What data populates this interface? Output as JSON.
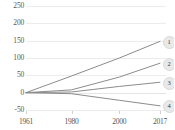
{
  "chart_data": {
    "type": "line",
    "title": "",
    "xlabel": "",
    "ylabel": "",
    "xlim": [
      1961,
      2017
    ],
    "ylim": [
      -50,
      250
    ],
    "grid": true,
    "legend_position": "right-inline-badges",
    "yticks": [
      250,
      200,
      150,
      100,
      50,
      0,
      -50
    ],
    "ytick_labels": [
      "250",
      "200",
      "150",
      "100",
      "50",
      "0",
      "-50"
    ],
    "xticks": [
      1961,
      1980,
      2000,
      2017
    ],
    "xtick_labels": [
      "1961",
      "1980",
      "2000",
      "2017"
    ],
    "series": [
      {
        "name": "1",
        "badge_label": "1",
        "color": "#8c8c8c",
        "x": [
          1961,
          1980,
          2000,
          2017
        ],
        "values": [
          0,
          48,
          100,
          148
        ]
      },
      {
        "name": "2",
        "badge_label": "2",
        "color": "#8c8c8c",
        "x": [
          1961,
          1980,
          2000,
          2017
        ],
        "values": [
          0,
          8,
          45,
          85
        ]
      },
      {
        "name": "3",
        "badge_label": "3",
        "color": "#8c8c8c",
        "x": [
          1961,
          1980,
          2000,
          2017
        ],
        "values": [
          0,
          2,
          18,
          30
        ]
      },
      {
        "name": "4",
        "badge_label": "4",
        "color": "#8c8c8c",
        "x": [
          1961,
          1980,
          2000,
          2017
        ],
        "values": [
          0,
          -3,
          -22,
          -38
        ]
      }
    ]
  }
}
